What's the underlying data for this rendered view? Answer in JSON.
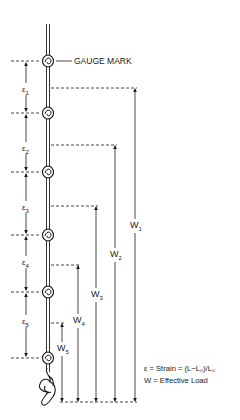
{
  "diagram": {
    "gauge_mark_label": "GAUGE MARK",
    "strain_labels": [
      {
        "symbol": "ε",
        "sub": "1"
      },
      {
        "symbol": "ε",
        "sub": "2"
      },
      {
        "symbol": "ε",
        "sub": "3"
      },
      {
        "symbol": "ε",
        "sub": "4"
      },
      {
        "symbol": "ε",
        "sub": "5"
      }
    ],
    "load_labels": [
      {
        "symbol": "W",
        "sub": "1"
      },
      {
        "symbol": "W",
        "sub": "2"
      },
      {
        "symbol": "W",
        "sub": "3"
      },
      {
        "symbol": "W",
        "sub": "4"
      },
      {
        "symbol": "W",
        "sub": "5"
      }
    ],
    "legend": {
      "line1": "ε = Strain = (L−L₀)/L₀",
      "line2": "W = Effective Load"
    },
    "knot_count": 6,
    "line_color": "#1a1a1a"
  }
}
